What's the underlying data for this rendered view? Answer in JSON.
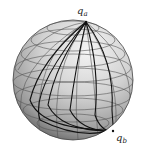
{
  "figure": {
    "type": "sphere-with-geodesic-paths",
    "labels": {
      "point_a": {
        "base": "q",
        "sub": "a"
      },
      "point_b": {
        "base": "q",
        "sub": "b"
      }
    },
    "colors": {
      "sphere_light": "#eeeeee",
      "sphere_mid": "#c8c8c8",
      "sphere_dark": "#6a6a6a",
      "grid": "#555555",
      "paths": "#111111"
    }
  }
}
